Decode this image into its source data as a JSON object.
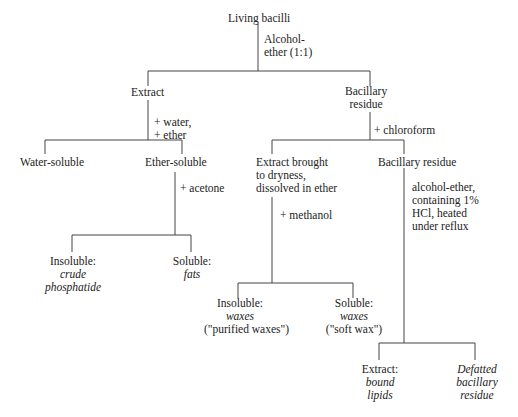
{
  "diagram": {
    "type": "flowchart",
    "root": "Living bacilli",
    "steps": {
      "s1": [
        "Alcohol-",
        "ether (1:1)"
      ],
      "s2": [
        "+ water,",
        "+ ether"
      ],
      "s3": "+ chloroform",
      "s4": "+ acetone",
      "s5": "+ methanol",
      "s6": [
        "alcohol-ether,",
        "containing 1%",
        "HCl, heated",
        "under reflux"
      ]
    },
    "nodes": {
      "extract": "Extract",
      "bac_residue": [
        "Bacillary",
        "residue"
      ],
      "water_soluble": "Water-soluble",
      "ether_soluble": "Ether-soluble",
      "extract_dry": [
        "Extract brought",
        "to dryness,",
        "dissolved in ether"
      ],
      "bac_residue2": "Bacillary residue",
      "insoluble1": {
        "label": "Insoluble:",
        "sub": [
          "crude",
          "phosphatide"
        ]
      },
      "soluble1": {
        "label": "Soluble:",
        "sub": [
          "fats"
        ]
      },
      "insoluble2": {
        "label": "Insoluble:",
        "sub": [
          "waxes"
        ],
        "note": "(\"purified waxes\")"
      },
      "soluble2": {
        "label": "Soluble:",
        "sub": [
          "waxes"
        ],
        "note": "(\"soft wax\")"
      },
      "extract3": {
        "label": "Extract:",
        "sub": [
          "bound",
          "lipids"
        ]
      },
      "defatted": [
        "Defatted",
        "bacillary",
        "residue"
      ]
    }
  }
}
